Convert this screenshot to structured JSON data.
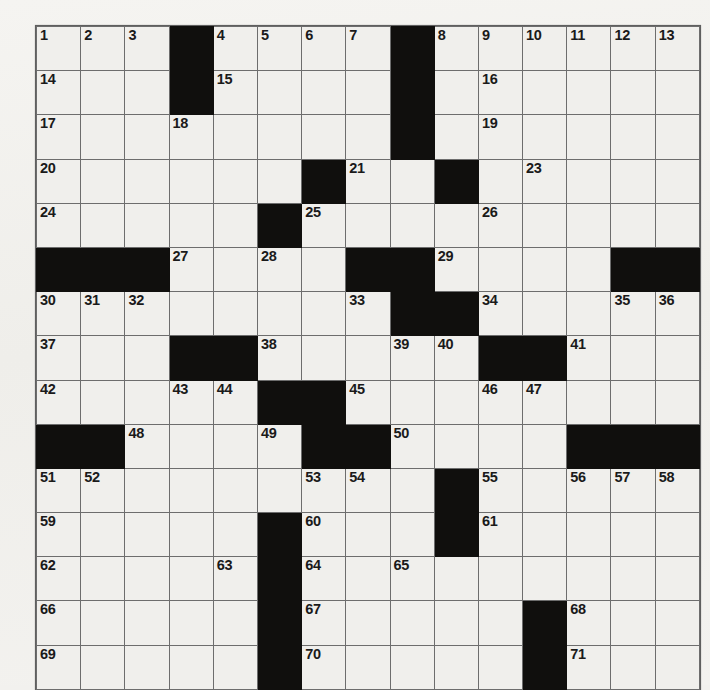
{
  "puzzle": {
    "type": "crossword-grid",
    "rows": 15,
    "cols": 15,
    "cell_color": "#f0efec",
    "block_color": "#100f0d",
    "line_color": "#6d6d6d",
    "background_color": "#f2f1ee",
    "blocks": [
      [
        0,
        3
      ],
      [
        0,
        8
      ],
      [
        1,
        3
      ],
      [
        1,
        8
      ],
      [
        2,
        8
      ],
      [
        3,
        6
      ],
      [
        3,
        9
      ],
      [
        4,
        5
      ],
      [
        5,
        0
      ],
      [
        5,
        1
      ],
      [
        5,
        2
      ],
      [
        5,
        7
      ],
      [
        5,
        8
      ],
      [
        5,
        13
      ],
      [
        5,
        14
      ],
      [
        6,
        8
      ],
      [
        6,
        9
      ],
      [
        7,
        3
      ],
      [
        7,
        4
      ],
      [
        7,
        10
      ],
      [
        7,
        11
      ],
      [
        8,
        5
      ],
      [
        8,
        6
      ],
      [
        9,
        0
      ],
      [
        9,
        1
      ],
      [
        9,
        6
      ],
      [
        9,
        7
      ],
      [
        9,
        12
      ],
      [
        9,
        13
      ],
      [
        9,
        14
      ],
      [
        10,
        9
      ],
      [
        11,
        5
      ],
      [
        11,
        9
      ],
      [
        12,
        5
      ],
      [
        13,
        5
      ],
      [
        13,
        11
      ],
      [
        14,
        5
      ],
      [
        14,
        11
      ]
    ],
    "numbers": [
      {
        "row": 0,
        "col": 0,
        "n": "1"
      },
      {
        "row": 0,
        "col": 1,
        "n": "2"
      },
      {
        "row": 0,
        "col": 2,
        "n": "3"
      },
      {
        "row": 0,
        "col": 4,
        "n": "4"
      },
      {
        "row": 0,
        "col": 5,
        "n": "5"
      },
      {
        "row": 0,
        "col": 6,
        "n": "6"
      },
      {
        "row": 0,
        "col": 7,
        "n": "7"
      },
      {
        "row": 0,
        "col": 9,
        "n": "8"
      },
      {
        "row": 0,
        "col": 10,
        "n": "9"
      },
      {
        "row": 0,
        "col": 11,
        "n": "10"
      },
      {
        "row": 0,
        "col": 12,
        "n": "11"
      },
      {
        "row": 0,
        "col": 13,
        "n": "12"
      },
      {
        "row": 0,
        "col": 14,
        "n": "13"
      },
      {
        "row": 1,
        "col": 0,
        "n": "14"
      },
      {
        "row": 1,
        "col": 4,
        "n": "15"
      },
      {
        "row": 1,
        "col": 10,
        "n": "16"
      },
      {
        "row": 2,
        "col": 0,
        "n": "17"
      },
      {
        "row": 2,
        "col": 3,
        "n": "18"
      },
      {
        "row": 2,
        "col": 10,
        "n": "19"
      },
      {
        "row": 3,
        "col": 0,
        "n": "20"
      },
      {
        "row": 3,
        "col": 7,
        "n": "21"
      },
      {
        "row": 3,
        "col": 9,
        "n": "22"
      },
      {
        "row": 3,
        "col": 11,
        "n": "23"
      },
      {
        "row": 4,
        "col": 0,
        "n": "24"
      },
      {
        "row": 4,
        "col": 6,
        "n": "25"
      },
      {
        "row": 4,
        "col": 10,
        "n": "26"
      },
      {
        "row": 5,
        "col": 3,
        "n": "27"
      },
      {
        "row": 5,
        "col": 5,
        "n": "28"
      },
      {
        "row": 5,
        "col": 9,
        "n": "29"
      },
      {
        "row": 6,
        "col": 0,
        "n": "30"
      },
      {
        "row": 6,
        "col": 1,
        "n": "31"
      },
      {
        "row": 6,
        "col": 2,
        "n": "32"
      },
      {
        "row": 6,
        "col": 7,
        "n": "33"
      },
      {
        "row": 6,
        "col": 10,
        "n": "34"
      },
      {
        "row": 6,
        "col": 13,
        "n": "35"
      },
      {
        "row": 6,
        "col": 14,
        "n": "36"
      },
      {
        "row": 7,
        "col": 0,
        "n": "37"
      },
      {
        "row": 7,
        "col": 5,
        "n": "38"
      },
      {
        "row": 7,
        "col": 8,
        "n": "39"
      },
      {
        "row": 7,
        "col": 9,
        "n": "40"
      },
      {
        "row": 7,
        "col": 12,
        "n": "41"
      },
      {
        "row": 8,
        "col": 0,
        "n": "42"
      },
      {
        "row": 8,
        "col": 3,
        "n": "43"
      },
      {
        "row": 8,
        "col": 4,
        "n": "44"
      },
      {
        "row": 8,
        "col": 7,
        "n": "45"
      },
      {
        "row": 8,
        "col": 10,
        "n": "46"
      },
      {
        "row": 8,
        "col": 11,
        "n": "47"
      },
      {
        "row": 9,
        "col": 2,
        "n": "48"
      },
      {
        "row": 9,
        "col": 5,
        "n": "49"
      },
      {
        "row": 9,
        "col": 8,
        "n": "50"
      },
      {
        "row": 10,
        "col": 0,
        "n": "51"
      },
      {
        "row": 10,
        "col": 1,
        "n": "52"
      },
      {
        "row": 10,
        "col": 6,
        "n": "53"
      },
      {
        "row": 10,
        "col": 7,
        "n": "54"
      },
      {
        "row": 10,
        "col": 10,
        "n": "55"
      },
      {
        "row": 10,
        "col": 12,
        "n": "56"
      },
      {
        "row": 10,
        "col": 13,
        "n": "57"
      },
      {
        "row": 10,
        "col": 14,
        "n": "58"
      },
      {
        "row": 11,
        "col": 0,
        "n": "59"
      },
      {
        "row": 11,
        "col": 6,
        "n": "60"
      },
      {
        "row": 11,
        "col": 10,
        "n": "61"
      },
      {
        "row": 12,
        "col": 0,
        "n": "62"
      },
      {
        "row": 12,
        "col": 4,
        "n": "63"
      },
      {
        "row": 12,
        "col": 6,
        "n": "64"
      },
      {
        "row": 12,
        "col": 8,
        "n": "65"
      },
      {
        "row": 13,
        "col": 0,
        "n": "66"
      },
      {
        "row": 13,
        "col": 6,
        "n": "67"
      },
      {
        "row": 13,
        "col": 12,
        "n": "68"
      },
      {
        "row": 14,
        "col": 0,
        "n": "69"
      },
      {
        "row": 14,
        "col": 6,
        "n": "70"
      },
      {
        "row": 14,
        "col": 12,
        "n": "71"
      }
    ]
  }
}
